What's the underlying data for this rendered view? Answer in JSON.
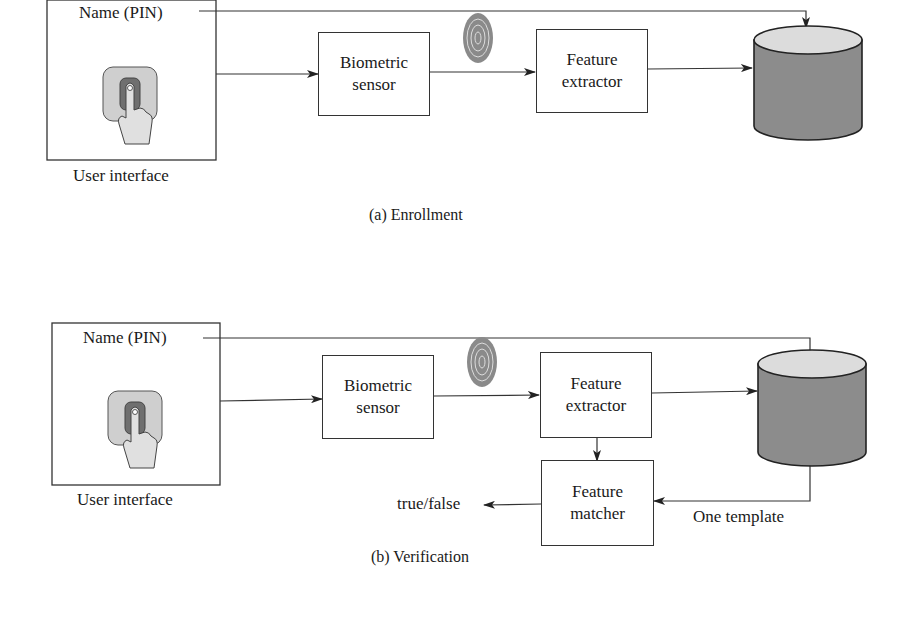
{
  "enrollment": {
    "caption": "(a) Enrollment",
    "user_interface": {
      "name_field": "Name (PIN)",
      "label": "User interface",
      "icon": "finger-press-icon"
    },
    "biometric_sensor": {
      "line1": "Biometric",
      "line2": "sensor"
    },
    "fingerprint_icon": "fingerprint-icon",
    "feature_extractor": {
      "line1": "Feature",
      "line2": "extractor"
    },
    "database_icon": "database-cylinder-icon"
  },
  "verification": {
    "caption": "(b) Verification",
    "user_interface": {
      "name_field": "Name (PIN)",
      "label": "User interface",
      "icon": "finger-press-icon"
    },
    "biometric_sensor": {
      "line1": "Biometric",
      "line2": "sensor"
    },
    "fingerprint_icon": "fingerprint-icon",
    "feature_extractor": {
      "line1": "Feature",
      "line2": "extractor"
    },
    "feature_matcher": {
      "line1": "Feature",
      "line2": "matcher"
    },
    "database_icon": "database-cylinder-icon",
    "output_label": "true/false",
    "template_label": "One template"
  },
  "colors": {
    "line": "#333333",
    "db_body": "#8c8c8c",
    "db_top": "#dcdcdc",
    "pad_outer": "#cfcfcf",
    "pad_inner": "#6f6f6f"
  }
}
